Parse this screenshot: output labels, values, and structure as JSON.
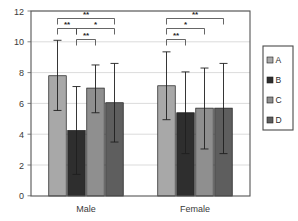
{
  "chart_data": {
    "type": "bar",
    "title": "",
    "subtitle": "",
    "xlabel": "",
    "ylabel": "",
    "categories": [
      "Male",
      "Female"
    ],
    "ylim": [
      0,
      12
    ],
    "yticks": [
      0,
      2,
      4,
      6,
      8,
      10,
      12
    ],
    "ytick_labels": [
      "0",
      "2",
      "4",
      "6",
      "8",
      "10",
      "12"
    ],
    "grid": true,
    "legend_position": "right",
    "series": [
      {
        "name": "A",
        "color": "#a8a8a8",
        "values": [
          7.8,
          7.15
        ],
        "err_low": [
          5.55,
          4.95
        ],
        "err_high": [
          10.1,
          9.35
        ]
      },
      {
        "name": "B",
        "color": "#2e2e2e",
        "values": [
          4.25,
          5.4
        ],
        "err_low": [
          1.4,
          2.75
        ],
        "err_high": [
          7.1,
          8.05
        ]
      },
      {
        "name": "C",
        "color": "#8f8f8f",
        "values": [
          7.0,
          5.7
        ],
        "err_low": [
          5.4,
          3.05
        ],
        "err_high": [
          8.5,
          8.3
        ]
      },
      {
        "name": "D",
        "color": "#5e5e5e",
        "values": [
          6.05,
          5.7
        ],
        "err_low": [
          3.5,
          2.75
        ],
        "err_high": [
          8.6,
          8.6
        ]
      }
    ],
    "annotations": [
      {
        "group": "Male",
        "from": "A",
        "to": "D",
        "label": "**",
        "level": 1
      },
      {
        "group": "Male",
        "from": "A",
        "to": "B",
        "label": "**",
        "level": 2
      },
      {
        "group": "Male",
        "from": "B",
        "to": "D",
        "label": "*",
        "level": 2
      },
      {
        "group": "Male",
        "from": "B",
        "to": "C",
        "label": "**",
        "level": 3
      },
      {
        "group": "Female",
        "from": "A",
        "to": "D",
        "label": "**",
        "level": 1
      },
      {
        "group": "Female",
        "from": "A",
        "to": "C",
        "label": "*",
        "level": 2
      },
      {
        "group": "Female",
        "from": "A",
        "to": "B",
        "label": "**",
        "level": 3
      }
    ]
  },
  "legend": {
    "items": [
      {
        "label": "A",
        "color": "#a8a8a8"
      },
      {
        "label": "B",
        "color": "#2e2e2e"
      },
      {
        "label": "C",
        "color": "#8f8f8f"
      },
      {
        "label": "D",
        "color": "#5e5e5e"
      }
    ]
  },
  "axis": {
    "y_tick_0": "0",
    "y_tick_1": "2",
    "y_tick_2": "4",
    "y_tick_3": "6",
    "y_tick_4": "8",
    "y_tick_5": "10",
    "y_tick_6": "12"
  },
  "colors": {
    "frame": "#555555",
    "grid": "#d2d2d2",
    "error_bar": "#1f1f1f",
    "bracket": "#3f3f3f",
    "background": "#ffffff"
  }
}
